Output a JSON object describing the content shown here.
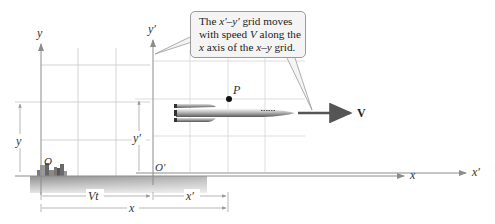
{
  "figure": {
    "callout": {
      "line1_pre": "The ",
      "line1_var": "x′–y′",
      "line1_post": " grid moves",
      "line2_pre": "with speed ",
      "line2_var": "V",
      "line2_post": " along the",
      "line3_var1": "x",
      "line3_mid": " axis of the ",
      "line3_var2": "x–y",
      "line3_post": " grid."
    },
    "labels": {
      "y_axis": "y",
      "y_prime_axis": "y′",
      "x_axis": "x",
      "x_prime_axis": "x′",
      "origin": "O",
      "origin_prime": "O′",
      "point": "P",
      "velocity": "V",
      "dim_y": "y",
      "dim_y_prime": "y′",
      "dim_Vt": "Vt",
      "dim_x_prime": "x′",
      "dim_x": "x"
    },
    "colors": {
      "grid": "#c8c8c8",
      "axis": "#8c8c8c",
      "ground": "#a8a8a8",
      "arrow_v": "#555555",
      "callout_bg": "#f4f4f4",
      "callout_border": "#9a9a9a"
    }
  }
}
